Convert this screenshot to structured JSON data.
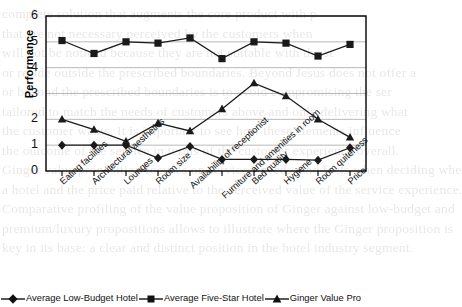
{
  "chart_data": {
    "type": "line",
    "title": "",
    "xlabel": "",
    "ylabel": "Performance",
    "ylim": [
      0,
      6
    ],
    "yticks": [
      0,
      1,
      2,
      3,
      4,
      5,
      6
    ],
    "grid": true,
    "legend_position": "bottom",
    "categories": [
      "Eating facilities",
      "Architectural aesthetics",
      "Lounges",
      "Room size",
      "Availability of receptionist",
      "Furniture and amenities in room",
      "Bed quality",
      "Hygiene",
      "Room quiteness",
      "Price"
    ],
    "series": [
      {
        "name": "Average Low-Budget Hotel",
        "marker": "diamond",
        "values": [
          1.0,
          1.0,
          1.0,
          0.5,
          0.95,
          0.45,
          0.45,
          0.45,
          0.42,
          0.9
        ]
      },
      {
        "name": "Average Five-Star Hotel",
        "marker": "square",
        "values": [
          5.05,
          4.55,
          5.0,
          4.95,
          5.15,
          4.35,
          5.0,
          4.95,
          4.45,
          4.9
        ]
      },
      {
        "name": "Ginger Value Pro",
        "marker": "triangle",
        "values": [
          2.0,
          1.6,
          1.15,
          1.85,
          1.55,
          2.4,
          3.4,
          2.9,
          2.0,
          1.3
        ]
      }
    ]
  },
  "legend": {
    "items": [
      {
        "label": "Average Low-Budget Hotel",
        "marker": "diamond"
      },
      {
        "label": "Average Five-Star Hotel",
        "marker": "square"
      },
      {
        "label": "Ginger Value Pro",
        "marker": "triangle"
      }
    ]
  },
  "colors": {
    "series_line": "#1a1a1a",
    "axis": "#000000",
    "grid": "#b0b0b0",
    "background": "#ffffff"
  },
  "background_text": {
    "lines": [
      "complete solution that augments the core product with p",
      "that are not necessary perceived by the customers when",
      "will not be noticed because they are not suitable with the st",
      "or reside outside the prescribed boundaries. Beyond Jesus does not offer a",
      "or beyond the prescribed boundaries is to avoid compromising the ser",
      "tailored to match the needs of customers above and only delivering what",
      "the customer wants. It is important to see how these elements influence",
      "the outcome of the service in terms of the customer experience overall.",
      "Ginger value proposition focuses on services, needs, and feels when deciding whe",
      "a hotel and the price paid relative to the perceived value of the service experience.",
      "Comparative profiling of the value proposition of Ginger against low-budget and",
      "premium/luxury propositions allows to illustrate where the Ginger proposition is",
      "key in its base: a clear and distinct position in the hotel industry segment."
    ]
  }
}
